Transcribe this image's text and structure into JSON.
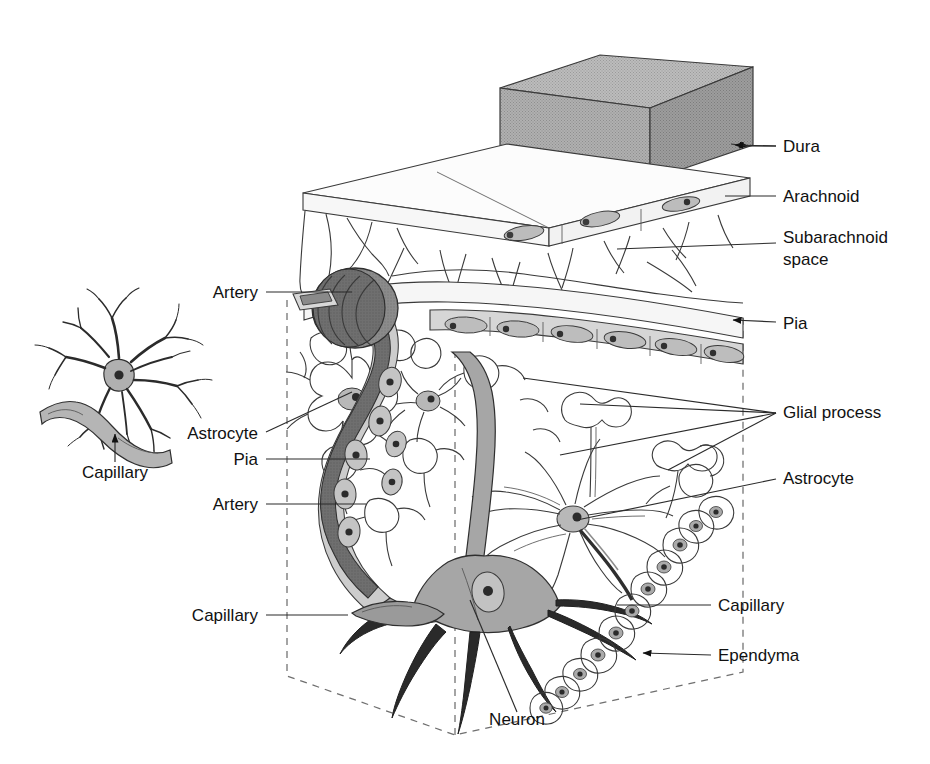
{
  "figure": {
    "background_color": "#ffffff",
    "line_color": "#3a3a3a",
    "text_color": "#111111"
  },
  "palette": {
    "dura_fill": "#a9a9a9",
    "dura_top_fill": "#b4b4b4",
    "dura_side_fill": "#9e9e9e",
    "arachnoid_fill": "#fbfbfb",
    "subarachnoid_fill": "#f4f4f4",
    "pia_fill": "#d6d6d6",
    "pia_cell_fill": "#bdbdbd",
    "artery_fill": "#8d8d8d",
    "artery_dark_fill": "#6d6d6d",
    "capillary_fill": "#9a9a9a",
    "neuron_fill": "#a6a6a6",
    "astrocyte_fill": "#fcfcfc",
    "astrocyte_nucleus_fill": "#b8b8b8",
    "ependyma_fill": "#c9c9c9",
    "glial_process_fill": "#f2f2f2",
    "nucleus_dark": "#3c3c3c",
    "dashed_box": "#6f6f6f"
  },
  "labels_right": [
    {
      "id": "dura",
      "text": "Dura",
      "x": 783,
      "y": 152,
      "leader_x1": 748,
      "leader_y1": 146,
      "leader_x2": 776,
      "leader_y2": 146,
      "arrow": true,
      "arrow_tip_x": 731,
      "arrow_tip_y": 144
    },
    {
      "id": "arachnoid",
      "text": "Arachnoid",
      "x": 783,
      "y": 202,
      "leader_x1": 725,
      "leader_y1": 196,
      "leader_x2": 776,
      "leader_y2": 196,
      "arrow": false
    },
    {
      "id": "subarachnoid-space",
      "text": "Subarachnoid",
      "x": 783,
      "y": 243,
      "leader_x1": 617,
      "leader_y1": 249,
      "leader_x2": 776,
      "leader_y2": 243,
      "arrow": false
    },
    {
      "id": "subarachnoid-space-line2",
      "text": "space",
      "x": 783,
      "y": 265,
      "leader_x1": null,
      "leader_y1": null,
      "leader_x2": null,
      "leader_y2": null,
      "arrow": false
    },
    {
      "id": "pia",
      "text": "Pia",
      "x": 783,
      "y": 329,
      "leader_x1": 746,
      "leader_y1": 322,
      "leader_x2": 776,
      "leader_y2": 322,
      "arrow": true,
      "arrow_tip_x": 729,
      "arrow_tip_y": 320
    },
    {
      "id": "glial-process",
      "text": "Glial process",
      "x": 783,
      "y": 418,
      "leader_x1": null,
      "leader_y1": null,
      "leader_x2": null,
      "leader_y2": null,
      "arrow": false
    },
    {
      "id": "astrocyte-right",
      "text": "Astrocyte",
      "x": 783,
      "y": 484,
      "leader_x1": 577,
      "leader_y1": 520,
      "leader_x2": 776,
      "leader_y2": 479,
      "arrow": false
    },
    {
      "id": "capillary-right",
      "text": "Capillary",
      "x": 718,
      "y": 611,
      "leader_x1": 617,
      "leader_y1": 605,
      "leader_x2": 711,
      "leader_y2": 605,
      "arrow": false
    },
    {
      "id": "ependyma",
      "text": "Ependyma",
      "x": 718,
      "y": 661,
      "leader_x1": 653,
      "leader_y1": 655,
      "leader_x2": 711,
      "leader_y2": 655,
      "arrow": true,
      "arrow_tip_x": 639,
      "arrow_tip_y": 652
    }
  ],
  "labels_left": [
    {
      "id": "artery-top",
      "text": "Artery",
      "x": 258,
      "y": 298,
      "leader_x1": 266,
      "leader_y1": 292,
      "leader_x2": 352,
      "leader_y2": 292,
      "arrow": false
    },
    {
      "id": "astrocyte-left",
      "text": "Astrocyte",
      "x": 258,
      "y": 439,
      "leader_x1": 266,
      "leader_y1": 432,
      "leader_x2": 352,
      "leader_y2": 392,
      "arrow": false
    },
    {
      "id": "pia-left",
      "text": "Pia",
      "x": 258,
      "y": 465,
      "leader_x1": 266,
      "leader_y1": 459,
      "leader_x2": 370,
      "leader_y2": 459,
      "arrow": false
    },
    {
      "id": "artery-lower",
      "text": "Artery",
      "x": 258,
      "y": 510,
      "leader_x1": 266,
      "leader_y1": 504,
      "leader_x2": 366,
      "leader_y2": 504,
      "arrow": false
    },
    {
      "id": "capillary-left",
      "text": "Capillary",
      "x": 258,
      "y": 621,
      "leader_x1": 266,
      "leader_y1": 615,
      "leader_x2": 348,
      "leader_y2": 615,
      "arrow": false
    }
  ],
  "labels_other": [
    {
      "id": "neuron",
      "text": "Neuron",
      "x": 517,
      "y": 725,
      "anchor": "middle",
      "leader_x1": 517,
      "leader_y1": 712,
      "leader_x2": 470,
      "leader_y2": 600,
      "arrow": false
    },
    {
      "id": "capillary-inset",
      "text": "Capillary",
      "x": 115,
      "y": 478,
      "anchor": "middle",
      "leader_x1": 115,
      "leader_y1": 462,
      "leader_x2": 115,
      "leader_y2": 438,
      "arrow": true,
      "arrow_tip_x": 115,
      "arrow_tip_y": 430
    }
  ],
  "glial_process_leaders": [
    {
      "x1": 580,
      "y1": 404,
      "x2": 776,
      "y2": 413
    },
    {
      "x1": 523,
      "y1": 378,
      "x2": 776,
      "y2": 413
    },
    {
      "x1": 560,
      "y1": 455,
      "x2": 776,
      "y2": 413
    },
    {
      "x1": 668,
      "y1": 470,
      "x2": 776,
      "y2": 413
    }
  ],
  "structures": {
    "dura": {
      "name": "dura-mater-block",
      "description": "Shaded rectangular 3D slab at top"
    },
    "arachnoid": {
      "name": "arachnoid-membrane",
      "description": "Thin flat sheet beneath the dura"
    },
    "subarachnoid_space": {
      "name": "subarachnoid-space",
      "description": "Open space with trabeculae between arachnoid and pia"
    },
    "pia": {
      "name": "pia-mater-layer",
      "description": "Thin cell layer hugging the cortical surface"
    },
    "artery": {
      "name": "artery-coil",
      "description": "Dark coiled vessel descending into cortex"
    },
    "neuron": {
      "name": "neuron-cell-body",
      "description": "Large multipolar neuron with axon and dendrites"
    },
    "astrocyte": {
      "name": "astrocyte-cell",
      "description": "Star shaped glial cell with endfeet"
    },
    "ependyma": {
      "name": "ependyma-cell-chain",
      "description": "Chain of cuboidal cells lining ventricle"
    },
    "capillary": {
      "name": "capillary-vessel",
      "description": "Small vessel within neuropil"
    },
    "glial_process": {
      "name": "glial-process-endfoot",
      "description": "Expanded glial endfoot"
    },
    "inset": {
      "name": "astrocyte-capillary-inset",
      "description": "Separate drawing of astrocyte contacting a capillary"
    },
    "dashed_box": {
      "name": "cortical-block-outline",
      "description": "Dashed 3D block outline around cortical tissue"
    }
  }
}
